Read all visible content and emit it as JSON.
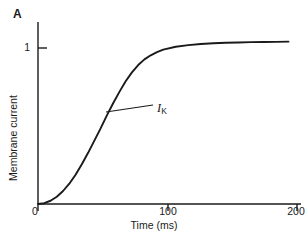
{
  "figure": {
    "panel_label": "A",
    "background_color": "#ffffff",
    "ink_color": "#1a1a1a"
  },
  "chart_data": {
    "type": "line",
    "title": "",
    "subtitle": "",
    "xlabel": "Time (ms)",
    "ylabel": "Membrane current",
    "xlim": [
      0,
      210
    ],
    "ylim": [
      0,
      1.12
    ],
    "xticks": [
      0,
      100,
      200
    ],
    "xticklabels": [
      "0",
      "100",
      "200"
    ],
    "yticks": [
      1
    ],
    "yticklabels": [
      "1"
    ],
    "grid": false,
    "legend": "none",
    "annotations": [
      {
        "text": "IK",
        "symbol": "I",
        "subscript": "K",
        "x": 52,
        "y": 0.5,
        "leader_from": [
          52,
          0.5
        ],
        "leader_to": [
          88,
          0.41
        ]
      }
    ],
    "series": [
      {
        "name": "IK",
        "x": [
          0,
          5,
          10,
          15,
          20,
          25,
          30,
          35,
          40,
          45,
          50,
          55,
          60,
          65,
          70,
          75,
          80,
          85,
          90,
          95,
          100,
          110,
          120,
          130,
          140,
          150,
          160,
          170,
          180,
          190,
          200
        ],
        "values": [
          0.0,
          0.005,
          0.02,
          0.045,
          0.08,
          0.125,
          0.18,
          0.245,
          0.315,
          0.39,
          0.465,
          0.545,
          0.62,
          0.69,
          0.755,
          0.81,
          0.855,
          0.89,
          0.915,
          0.935,
          0.95,
          0.968,
          0.978,
          0.985,
          0.989,
          0.992,
          0.994,
          0.996,
          0.997,
          0.998,
          0.999
        ]
      }
    ]
  },
  "axes": {
    "x_axis_name": "time-axis",
    "y_axis_name": "membrane-current-axis"
  }
}
